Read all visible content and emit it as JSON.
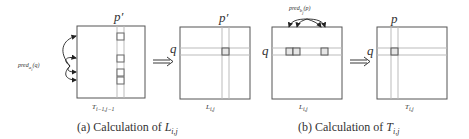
{
  "panel_a": {
    "caption_prefix": "(a) Calculation of ",
    "caption_var": "L",
    "caption_sub": "i,j",
    "matrix1_label": "T",
    "matrix1_sub": "i−1,j−1",
    "matrix1_top_label": "p′",
    "side_label": "pred",
    "side_label_sub": "a",
    "side_label_subsub": "i",
    "side_label_arg": "(q)",
    "matrix2_label": "L",
    "matrix2_sub": "i,j",
    "matrix2_top_label": "p′",
    "matrix2_row_label": "q"
  },
  "panel_b": {
    "caption_prefix": "(b) Calculation of ",
    "caption_var": "T",
    "caption_sub": "i,j",
    "matrix3_label": "L",
    "matrix3_sub": "i,j",
    "matrix3_row_label": "q",
    "top_label": "pred",
    "top_label_sub": "b",
    "top_label_subsub": "j",
    "top_label_arg": "(p)",
    "matrix4_label": "T",
    "matrix4_sub": "i,j",
    "matrix4_top_label": "p",
    "matrix4_row_label": "q"
  },
  "colors": {
    "frame": "#555555",
    "grid_line": "#bbbbbb",
    "cell_fill": "#e6e6e6",
    "arrow": "#222222"
  }
}
